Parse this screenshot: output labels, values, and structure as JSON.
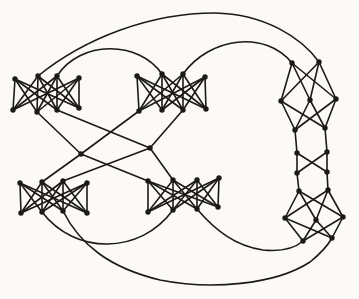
{
  "figure": {
    "type": "graph-diagram",
    "background": "#fbfaf7",
    "ink": "#1c1a18",
    "stroke_width": 1.6,
    "node_radius": 2.7,
    "width": 359,
    "height": 299,
    "nodes": {
      "at1": [
        15,
        79
      ],
      "at2": [
        38,
        76
      ],
      "at3": [
        57,
        76
      ],
      "at4": [
        79,
        78
      ],
      "ab1": [
        13,
        110
      ],
      "ab2": [
        37,
        112
      ],
      "ab3": [
        57,
        110
      ],
      "ab4": [
        79,
        108
      ],
      "bt1": [
        137,
        76
      ],
      "bt2": [
        162,
        74
      ],
      "bt3": [
        183,
        74
      ],
      "bt4": [
        205,
        77
      ],
      "bb1": [
        139,
        111
      ],
      "bb2": [
        162,
        110
      ],
      "bb3": [
        183,
        110
      ],
      "bb4": [
        206,
        109
      ],
      "ct1": [
        20,
        183
      ],
      "ct2": [
        42,
        182
      ],
      "ct3": [
        63,
        181
      ],
      "ct4": [
        87,
        183
      ],
      "cb1": [
        21,
        213
      ],
      "cb2": [
        42,
        212
      ],
      "cb3": [
        63,
        211
      ],
      "cb4": [
        87,
        213
      ],
      "dt1": [
        148,
        181
      ],
      "dt2": [
        173,
        180
      ],
      "dt3": [
        197,
        180
      ],
      "dt4": [
        219,
        178
      ],
      "db1": [
        148,
        212
      ],
      "db2": [
        173,
        210
      ],
      "db3": [
        197,
        209
      ],
      "db4": [
        218,
        207
      ],
      "ep1": [
        292,
        63
      ],
      "ep2": [
        319,
        62
      ],
      "em1": [
        281,
        101
      ],
      "em2": [
        310,
        100
      ],
      "em3": [
        336,
        99
      ],
      "ep3": [
        295,
        130
      ],
      "ep4": [
        325,
        128
      ],
      "l1": [
        297,
        153
      ],
      "r1": [
        327,
        152
      ],
      "l2": [
        297,
        173
      ],
      "r2": [
        327,
        172
      ],
      "fp1": [
        299,
        191
      ],
      "fp2": [
        328,
        190
      ],
      "fm1": [
        285,
        218
      ],
      "fm2": [
        316,
        220
      ],
      "fm3": [
        343,
        217
      ],
      "fp3": [
        303,
        241
      ],
      "fp4": [
        332,
        238
      ],
      "ml": [
        81,
        154
      ],
      "mr": [
        150,
        148
      ]
    },
    "edges": [
      [
        "at1",
        "ab1"
      ],
      [
        "at1",
        "ab2"
      ],
      [
        "at1",
        "ab3"
      ],
      [
        "at1",
        "ab4"
      ],
      [
        "at2",
        "ab1"
      ],
      [
        "at2",
        "ab2"
      ],
      [
        "at2",
        "ab3"
      ],
      [
        "at2",
        "ab4"
      ],
      [
        "at3",
        "ab1"
      ],
      [
        "at3",
        "ab2"
      ],
      [
        "at3",
        "ab3"
      ],
      [
        "at3",
        "ab4"
      ],
      [
        "at4",
        "ab1"
      ],
      [
        "at4",
        "ab2"
      ],
      [
        "at4",
        "ab3"
      ],
      [
        "at4",
        "ab4"
      ],
      [
        "bt1",
        "bb1"
      ],
      [
        "bt1",
        "bb2"
      ],
      [
        "bt1",
        "bb3"
      ],
      [
        "bt1",
        "bb4"
      ],
      [
        "bt2",
        "bb1"
      ],
      [
        "bt2",
        "bb2"
      ],
      [
        "bt2",
        "bb3"
      ],
      [
        "bt2",
        "bb4"
      ],
      [
        "bt3",
        "bb1"
      ],
      [
        "bt3",
        "bb2"
      ],
      [
        "bt3",
        "bb3"
      ],
      [
        "bt3",
        "bb4"
      ],
      [
        "bt4",
        "bb1"
      ],
      [
        "bt4",
        "bb2"
      ],
      [
        "bt4",
        "bb3"
      ],
      [
        "bt4",
        "bb4"
      ],
      [
        "ct1",
        "cb1"
      ],
      [
        "ct1",
        "cb2"
      ],
      [
        "ct1",
        "cb3"
      ],
      [
        "ct1",
        "cb4"
      ],
      [
        "ct2",
        "cb1"
      ],
      [
        "ct2",
        "cb2"
      ],
      [
        "ct2",
        "cb3"
      ],
      [
        "ct2",
        "cb4"
      ],
      [
        "ct3",
        "cb1"
      ],
      [
        "ct3",
        "cb2"
      ],
      [
        "ct3",
        "cb3"
      ],
      [
        "ct3",
        "cb4"
      ],
      [
        "ct4",
        "cb1"
      ],
      [
        "ct4",
        "cb2"
      ],
      [
        "ct4",
        "cb3"
      ],
      [
        "ct4",
        "cb4"
      ],
      [
        "dt1",
        "db1"
      ],
      [
        "dt1",
        "db2"
      ],
      [
        "dt1",
        "db3"
      ],
      [
        "dt1",
        "db4"
      ],
      [
        "dt2",
        "db1"
      ],
      [
        "dt2",
        "db2"
      ],
      [
        "dt2",
        "db3"
      ],
      [
        "dt2",
        "db4"
      ],
      [
        "dt3",
        "db1"
      ],
      [
        "dt3",
        "db2"
      ],
      [
        "dt3",
        "db3"
      ],
      [
        "dt3",
        "db4"
      ],
      [
        "dt4",
        "db1"
      ],
      [
        "dt4",
        "db2"
      ],
      [
        "dt4",
        "db3"
      ],
      [
        "dt4",
        "db4"
      ],
      [
        "ep1",
        "em1"
      ],
      [
        "ep1",
        "em2"
      ],
      [
        "ep1",
        "em3"
      ],
      [
        "ep2",
        "em1"
      ],
      [
        "ep2",
        "em2"
      ],
      [
        "ep2",
        "em3"
      ],
      [
        "ep3",
        "em1"
      ],
      [
        "ep3",
        "em2"
      ],
      [
        "ep3",
        "em3"
      ],
      [
        "ep4",
        "em1"
      ],
      [
        "ep4",
        "em2"
      ],
      [
        "ep4",
        "em3"
      ],
      [
        "fp1",
        "fm1"
      ],
      [
        "fp1",
        "fm2"
      ],
      [
        "fp1",
        "fm3"
      ],
      [
        "fp2",
        "fm1"
      ],
      [
        "fp2",
        "fm2"
      ],
      [
        "fp2",
        "fm3"
      ],
      [
        "fp3",
        "fm1"
      ],
      [
        "fp3",
        "fm2"
      ],
      [
        "fp3",
        "fm3"
      ],
      [
        "fp4",
        "fm1"
      ],
      [
        "fp4",
        "fm2"
      ],
      [
        "fp4",
        "fm3"
      ],
      [
        "ep3",
        "l1"
      ],
      [
        "l1",
        "l2"
      ],
      [
        "l2",
        "fp1"
      ],
      [
        "ep4",
        "r1"
      ],
      [
        "r1",
        "r2"
      ],
      [
        "r2",
        "fp2"
      ],
      [
        "l1",
        "r2"
      ],
      [
        "r1",
        "l2"
      ],
      [
        "ml",
        "ab2"
      ],
      [
        "ml",
        "bb1"
      ],
      [
        "ml",
        "ct2"
      ],
      [
        "ml",
        "dt1"
      ],
      [
        "mr",
        "ab3"
      ],
      [
        "mr",
        "bb3"
      ],
      [
        "mr",
        "ct3"
      ],
      [
        "mr",
        "dt2"
      ],
      [
        "at2",
        "ep2",
        "M 38 76 C 85 38, 150 13, 215 13 C 265 14, 302 38, 319 62"
      ],
      [
        "at3",
        "bt2",
        "M 57 76 C 80 40, 139 40, 162 74"
      ],
      [
        "bt3",
        "ep1",
        "M 183 74 C 210 37, 265 30, 292 63"
      ],
      [
        "cb2",
        "db2",
        "M 42 212 C 75 255, 140 255, 173 210"
      ],
      [
        "cb3",
        "fp4",
        "M 63 211 C 80 245, 110 268, 160 280 C 210 290, 275 285, 310 262 C 320 254, 327 247, 332 238"
      ],
      [
        "db3",
        "fp3",
        "M 197 209 C 215 230, 235 246, 263 250 C 283 252, 295 248, 303 241"
      ]
    ]
  }
}
